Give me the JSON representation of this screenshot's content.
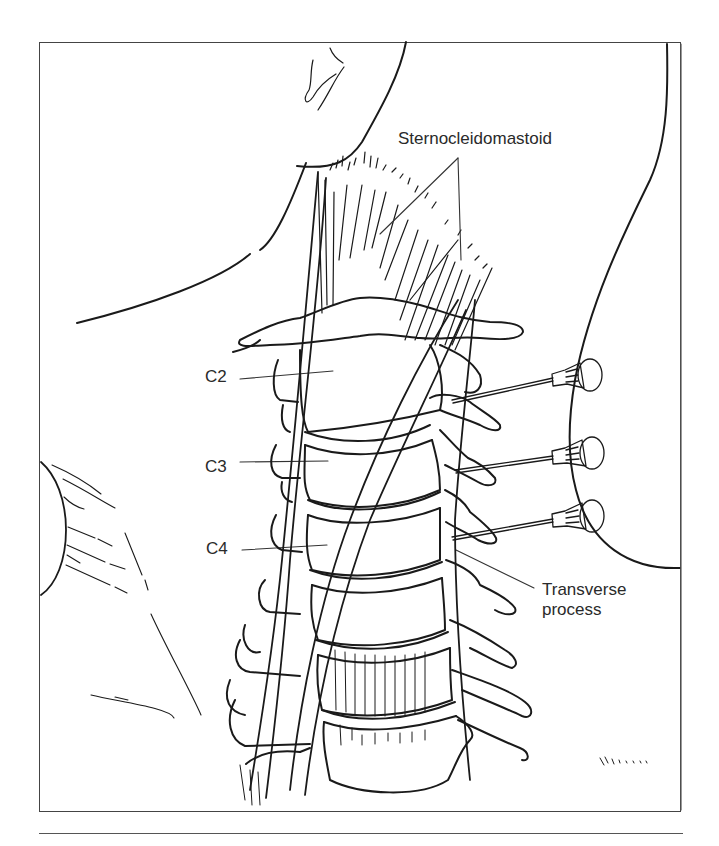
{
  "figure": {
    "labels": {
      "sternocleidomastoid": "Sternocleidomastoid",
      "c2": "C2",
      "c3": "C3",
      "c4": "C4",
      "transverse_process_line1": "Transverse",
      "transverse_process_line2": "process"
    },
    "needles": [
      {
        "target": "C2",
        "count_index": 1
      },
      {
        "target": "C3",
        "count_index": 2
      },
      {
        "target": "C4",
        "count_index": 3
      }
    ],
    "colors": {
      "line": "#1a1a1a",
      "frame": "#444444",
      "text": "#2a2a2a",
      "background": "#ffffff"
    }
  }
}
